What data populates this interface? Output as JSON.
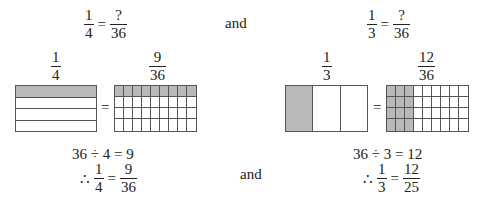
{
  "top": {
    "left_equation": {
      "lhs": {
        "num": "1",
        "den": "4"
      },
      "op": "=",
      "rhs": {
        "num": "?",
        "den": "36"
      }
    },
    "connector": "and",
    "right_equation": {
      "lhs": {
        "num": "1",
        "den": "3"
      },
      "op": "=",
      "rhs": {
        "num": "?",
        "den": "36"
      }
    }
  },
  "models": {
    "left": {
      "label_a": {
        "num": "1",
        "den": "4"
      },
      "label_b": {
        "num": "9",
        "den": "36"
      },
      "equals": "=",
      "model_a": {
        "rows": 4,
        "cols": 1,
        "shaded": "row 1"
      },
      "model_b": {
        "rows": 4,
        "cols": 9,
        "shaded": "row 1"
      }
    },
    "right": {
      "label_a": {
        "num": "1",
        "den": "3"
      },
      "label_b": {
        "num": "12",
        "den": "36"
      },
      "equals": "=",
      "model_a": {
        "rows": 1,
        "cols": 3,
        "shaded": "col 1"
      },
      "model_b": {
        "rows": 4,
        "cols": 9,
        "shaded": "cols 1-3"
      }
    }
  },
  "bottom": {
    "left": {
      "division": "36 ÷ 4 = 9",
      "therefore": "∴",
      "result": {
        "lhs": {
          "num": "1",
          "den": "4"
        },
        "op": "=",
        "rhs": {
          "num": "9",
          "den": "36"
        }
      }
    },
    "connector": "and",
    "right": {
      "division": "36 ÷ 3 = 12",
      "therefore": "∴",
      "result": {
        "lhs": {
          "num": "1",
          "den": "3"
        },
        "op": "=",
        "rhs": {
          "num": "12",
          "den": "25"
        }
      }
    }
  },
  "colors": {
    "shade": "#b9b9b9",
    "line": "#555555",
    "text": "#222222"
  }
}
